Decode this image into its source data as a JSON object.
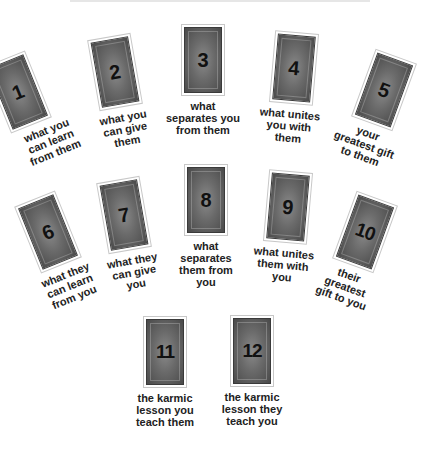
{
  "diagram": {
    "cards": [
      {
        "number": "1",
        "caption": "what you\ncan learn\nfrom them"
      },
      {
        "number": "2",
        "caption": "what you\ncan give\nthem"
      },
      {
        "number": "3",
        "caption": "what\nseparates you\nfrom them"
      },
      {
        "number": "4",
        "caption": "what unites\nyou with\nthem"
      },
      {
        "number": "5",
        "caption": "your\ngreatest gift\nto them"
      },
      {
        "number": "6",
        "caption": "what they\ncan learn\nfrom you"
      },
      {
        "number": "7",
        "caption": "what they\ncan give\nyou"
      },
      {
        "number": "8",
        "caption": "what\nseparates\nthem from\nyou"
      },
      {
        "number": "9",
        "caption": "what unites\nthem with\nyou"
      },
      {
        "number": "10",
        "caption": "their\ngreatest\ngift to you"
      },
      {
        "number": "11",
        "caption": "the karmic\nlesson you\nteach them"
      },
      {
        "number": "12",
        "caption": "the karmic\nlesson they\nteach you"
      }
    ]
  }
}
